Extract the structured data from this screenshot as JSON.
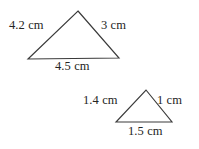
{
  "figure": {
    "background_color": "#ffffff",
    "stroke_color": "#3a3a3a",
    "text_color": "#242424",
    "shapes": [
      {
        "name": "large-triangle",
        "vertices": [
          [
            78,
            11
          ],
          [
            119,
            58
          ],
          [
            28,
            59
          ]
        ],
        "labels": {
          "left_side": "4.2 cm",
          "right_side": "3 cm",
          "base": "4.5 cm"
        }
      },
      {
        "name": "small-triangle",
        "vertices": [
          [
            146,
            90
          ],
          [
            172,
            122
          ],
          [
            116,
            122
          ]
        ],
        "labels": {
          "left_side": "1.4 cm",
          "right_side": "1 cm",
          "base": "1.5 cm"
        }
      }
    ]
  }
}
